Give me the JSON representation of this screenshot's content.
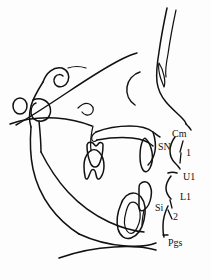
{
  "figure": {
    "name": "lateral-cephalometric-tracing",
    "background_color": "#fdfdfd",
    "line_color": "#111111"
  },
  "labels": [
    {
      "id": "cm",
      "text": "Cm",
      "x": 172,
      "y": 129,
      "meaning": "columella-point"
    },
    {
      "id": "sn",
      "text": "SN",
      "x": 158,
      "y": 142,
      "meaning": "subnasale-point"
    },
    {
      "id": "ang1",
      "text": "1",
      "x": 186,
      "y": 148,
      "meaning": "nasolabial-angle-arm-1"
    },
    {
      "id": "u1",
      "text": "U1",
      "x": 183,
      "y": 172,
      "meaning": "upper-lip-point"
    },
    {
      "id": "l1",
      "text": "L1",
      "x": 180,
      "y": 192,
      "meaning": "lower-lip-point"
    },
    {
      "id": "si",
      "text": "Si",
      "x": 155,
      "y": 203,
      "meaning": "sulcus-inferius-point"
    },
    {
      "id": "ang2",
      "text": "2",
      "x": 173,
      "y": 212,
      "meaning": "mentolabial-angle-arm-2"
    },
    {
      "id": "pgs",
      "text": "Pgs",
      "x": 168,
      "y": 238,
      "meaning": "soft-tissue-pogonion"
    }
  ],
  "structures": [
    {
      "id": "soft-tissue-profile",
      "label": "Soft tissue facial profile"
    },
    {
      "id": "cranial-base",
      "label": "Cranial base and sella turcica"
    },
    {
      "id": "orbit",
      "label": "Orbital rim"
    },
    {
      "id": "maxilla",
      "label": "Maxilla and hard palate"
    },
    {
      "id": "mandible",
      "label": "Mandible body and ramus"
    },
    {
      "id": "upper-molar",
      "label": "Upper first molar"
    },
    {
      "id": "lower-molar",
      "label": "Lower first molar"
    },
    {
      "id": "upper-incisor",
      "label": "Upper central incisor"
    },
    {
      "id": "lower-incisor",
      "label": "Lower central incisor"
    },
    {
      "id": "condyle",
      "label": "Mandibular condyle"
    },
    {
      "id": "neck-outline",
      "label": "Submental neck outline"
    }
  ]
}
